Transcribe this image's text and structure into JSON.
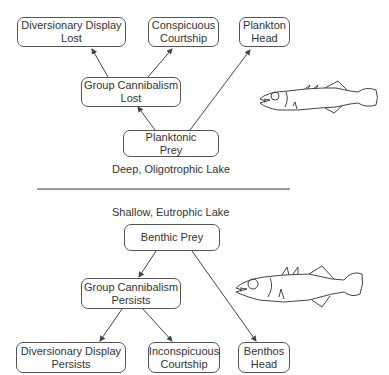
{
  "top_section": {
    "caption": "Deep, Oligotrophic Lake",
    "nodes": {
      "diversionary_display": {
        "line1": "Diversionary Display",
        "line2": "Lost"
      },
      "conspicuous_courtship": {
        "line1": "Conspicuous",
        "line2": "Courtship"
      },
      "plankton_head": {
        "line1": "Plankton",
        "line2": "Head"
      },
      "group_cannibalism": {
        "line1": "Group Cannibalism",
        "line2": "Lost"
      },
      "planktonic_prey": {
        "line1": "Planktonic",
        "line2": "Prey"
      }
    },
    "edges": [
      {
        "from": "Planktonic Prey",
        "to": "Group Cannibalism Lost"
      },
      {
        "from": "Planktonic Prey",
        "to": "Plankton Head"
      },
      {
        "from": "Group Cannibalism Lost",
        "to": "Diversionary Display Lost"
      },
      {
        "from": "Group Cannibalism Lost",
        "to": "Conspicuous Courtship"
      }
    ],
    "illustration": "limnetic-stickleback-fish"
  },
  "bottom_section": {
    "caption": "Shallow, Eutrophic Lake",
    "nodes": {
      "benthic_prey": {
        "line1": "Benthic Prey"
      },
      "group_cannibalism": {
        "line1": "Group Cannibalism",
        "line2": "Persists"
      },
      "diversionary_display": {
        "line1": "Diversionary Display",
        "line2": "Persists"
      },
      "inconspicuous_courtship": {
        "line1": "Inconspicuous",
        "line2": "Courtship"
      },
      "benthos_head": {
        "line1": "Benthos",
        "line2": "Head"
      }
    },
    "edges": [
      {
        "from": "Benthic Prey",
        "to": "Group Cannibalism Persists"
      },
      {
        "from": "Benthic Prey",
        "to": "Benthos Head"
      },
      {
        "from": "Group Cannibalism Persists",
        "to": "Diversionary Display Persists"
      },
      {
        "from": "Group Cannibalism Persists",
        "to": "Inconspicuous Courtship"
      }
    ],
    "illustration": "benthic-stickleback-fish"
  }
}
